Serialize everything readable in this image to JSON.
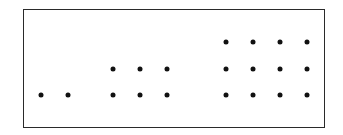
{
  "diagram": {
    "frame": {
      "border_color": "#2a2a2a",
      "background": "#ffffff"
    },
    "dot_color": "#111111",
    "groups": [
      {
        "name": "group-2",
        "count": 2,
        "rows": 1,
        "cols": 2,
        "dots": [
          [
            41,
            95
          ],
          [
            68,
            95
          ]
        ]
      },
      {
        "name": "group-6",
        "count": 6,
        "rows": 2,
        "cols": 3,
        "dots": [
          [
            113,
            69
          ],
          [
            140,
            69
          ],
          [
            167,
            69
          ],
          [
            113,
            95
          ],
          [
            140,
            95
          ],
          [
            167,
            95
          ]
        ]
      },
      {
        "name": "group-12",
        "count": 12,
        "rows": 3,
        "cols": 4,
        "dots": [
          [
            226,
            42
          ],
          [
            253,
            42
          ],
          [
            280,
            42
          ],
          [
            307,
            42
          ],
          [
            226,
            69
          ],
          [
            253,
            69
          ],
          [
            280,
            69
          ],
          [
            307,
            69
          ],
          [
            226,
            95
          ],
          [
            253,
            95
          ],
          [
            280,
            95
          ],
          [
            307,
            95
          ]
        ]
      }
    ]
  }
}
